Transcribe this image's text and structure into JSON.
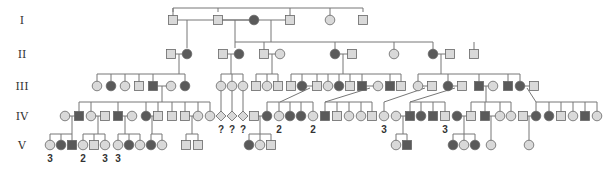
{
  "colors": {
    "affected": "#5a5a5a",
    "unaffected": "#d9d9d9",
    "stroke": "#666666",
    "line": "#777777"
  },
  "legend_symbols": {
    "square": "male",
    "circle": "female",
    "diamond": "sex unknown",
    "filled": "affected",
    "open": "unaffected"
  },
  "generations": [
    {
      "label": "I",
      "y": 20
    },
    {
      "label": "II",
      "y": 54
    },
    {
      "label": "III",
      "y": 86
    },
    {
      "label": "IV",
      "y": 116
    },
    {
      "label": "V",
      "y": 145
    }
  ],
  "individuals": [
    {
      "id": "I-1",
      "gen": 0,
      "x": 173,
      "sex": "M",
      "affected": false
    },
    {
      "id": "I-2",
      "gen": 0,
      "x": 218,
      "sex": "M",
      "affected": false
    },
    {
      "id": "I-3",
      "gen": 0,
      "x": 254,
      "sex": "F",
      "affected": true
    },
    {
      "id": "I-4",
      "gen": 0,
      "x": 290,
      "sex": "M",
      "affected": false
    },
    {
      "id": "I-5",
      "gen": 0,
      "x": 330,
      "sex": "F",
      "affected": false
    },
    {
      "id": "I-6",
      "gen": 0,
      "x": 363,
      "sex": "M",
      "affected": false
    },
    {
      "id": "II-1",
      "gen": 1,
      "x": 171,
      "sex": "M",
      "affected": false
    },
    {
      "id": "II-2",
      "gen": 1,
      "x": 187,
      "sex": "F",
      "affected": true
    },
    {
      "id": "II-3",
      "gen": 1,
      "x": 223,
      "sex": "M",
      "affected": false
    },
    {
      "id": "II-4",
      "gen": 1,
      "x": 239,
      "sex": "F",
      "affected": true
    },
    {
      "id": "II-5",
      "gen": 1,
      "x": 264,
      "sex": "M",
      "affected": false
    },
    {
      "id": "II-6",
      "gen": 1,
      "x": 280,
      "sex": "F",
      "affected": false
    },
    {
      "id": "II-7",
      "gen": 1,
      "x": 335,
      "sex": "F",
      "affected": true
    },
    {
      "id": "II-8",
      "gen": 1,
      "x": 352,
      "sex": "M",
      "affected": false
    },
    {
      "id": "II-9",
      "gen": 1,
      "x": 394,
      "sex": "F",
      "affected": false
    },
    {
      "id": "II-10",
      "gen": 1,
      "x": 433,
      "sex": "F",
      "affected": true
    },
    {
      "id": "II-11",
      "gen": 1,
      "x": 450,
      "sex": "M",
      "affected": false
    },
    {
      "id": "II-12",
      "gen": 1,
      "x": 474,
      "sex": "M",
      "affected": false
    },
    {
      "id": "III-1",
      "gen": 2,
      "x": 97,
      "sex": "F",
      "affected": false
    },
    {
      "id": "III-2",
      "gen": 2,
      "x": 111,
      "sex": "F",
      "affected": true
    },
    {
      "id": "III-3",
      "gen": 2,
      "x": 125,
      "sex": "F",
      "affected": false
    },
    {
      "id": "III-4",
      "gen": 2,
      "x": 139,
      "sex": "M",
      "affected": false
    },
    {
      "id": "III-5",
      "gen": 2,
      "x": 153,
      "sex": "M",
      "affected": true
    },
    {
      "id": "III-6",
      "gen": 2,
      "x": 171,
      "sex": "F",
      "affected": false
    },
    {
      "id": "III-7",
      "gen": 2,
      "x": 185,
      "sex": "F",
      "affected": true
    },
    {
      "id": "III-8",
      "gen": 2,
      "x": 221,
      "sex": "F",
      "affected": false
    },
    {
      "id": "III-9",
      "gen": 2,
      "x": 232,
      "sex": "F",
      "affected": false
    },
    {
      "id": "III-10",
      "gen": 2,
      "x": 243,
      "sex": "F",
      "affected": false
    },
    {
      "id": "III-11",
      "gen": 2,
      "x": 256,
      "sex": "M",
      "affected": false
    },
    {
      "id": "III-12",
      "gen": 2,
      "x": 267,
      "sex": "F",
      "affected": false
    },
    {
      "id": "III-13",
      "gen": 2,
      "x": 278,
      "sex": "M",
      "affected": false
    },
    {
      "id": "III-14",
      "gen": 2,
      "x": 291,
      "sex": "M",
      "affected": false
    },
    {
      "id": "III-15",
      "gen": 2,
      "x": 302,
      "sex": "F",
      "affected": true
    },
    {
      "id": "III-16",
      "gen": 2,
      "x": 317,
      "sex": "M",
      "affected": false
    },
    {
      "id": "III-17",
      "gen": 2,
      "x": 328,
      "sex": "F",
      "affected": false
    },
    {
      "id": "III-18",
      "gen": 2,
      "x": 339,
      "sex": "F",
      "affected": true
    },
    {
      "id": "III-19",
      "gen": 2,
      "x": 350,
      "sex": "M",
      "affected": false
    },
    {
      "id": "III-20",
      "gen": 2,
      "x": 362,
      "sex": "M",
      "affected": true
    },
    {
      "id": "III-21",
      "gen": 2,
      "x": 378,
      "sex": "F",
      "affected": false
    },
    {
      "id": "III-22",
      "gen": 2,
      "x": 390,
      "sex": "M",
      "affected": true
    },
    {
      "id": "III-23",
      "gen": 2,
      "x": 401,
      "sex": "M",
      "affected": false
    },
    {
      "id": "III-24",
      "gen": 2,
      "x": 418,
      "sex": "F",
      "affected": false
    },
    {
      "id": "III-25",
      "gen": 2,
      "x": 432,
      "sex": "M",
      "affected": false
    },
    {
      "id": "III-26",
      "gen": 2,
      "x": 448,
      "sex": "F",
      "affected": true
    },
    {
      "id": "III-27",
      "gen": 2,
      "x": 462,
      "sex": "M",
      "affected": false
    },
    {
      "id": "III-28",
      "gen": 2,
      "x": 479,
      "sex": "M",
      "affected": true
    },
    {
      "id": "III-29",
      "gen": 2,
      "x": 493,
      "sex": "F",
      "affected": false
    },
    {
      "id": "III-30",
      "gen": 2,
      "x": 508,
      "sex": "M",
      "affected": true
    },
    {
      "id": "III-31",
      "gen": 2,
      "x": 520,
      "sex": "F",
      "affected": true
    },
    {
      "id": "III-32",
      "gen": 2,
      "x": 534,
      "sex": "M",
      "affected": false
    },
    {
      "id": "IV-1",
      "gen": 3,
      "x": 65,
      "sex": "F",
      "affected": false
    },
    {
      "id": "IV-2",
      "gen": 3,
      "x": 79,
      "sex": "M",
      "affected": true
    },
    {
      "id": "IV-3",
      "gen": 3,
      "x": 91,
      "sex": "F",
      "affected": false
    },
    {
      "id": "IV-4",
      "gen": 3,
      "x": 105,
      "sex": "M",
      "affected": false
    },
    {
      "id": "IV-5",
      "gen": 3,
      "x": 118,
      "sex": "M",
      "affected": true
    },
    {
      "id": "IV-6",
      "gen": 3,
      "x": 132,
      "sex": "F",
      "affected": false
    },
    {
      "id": "IV-7",
      "gen": 3,
      "x": 146,
      "sex": "F",
      "affected": true
    },
    {
      "id": "IV-8",
      "gen": 3,
      "x": 158,
      "sex": "M",
      "affected": false
    },
    {
      "id": "IV-9",
      "gen": 3,
      "x": 172,
      "sex": "M",
      "affected": false
    },
    {
      "id": "IV-10",
      "gen": 3,
      "x": 185,
      "sex": "M",
      "affected": false
    },
    {
      "id": "IV-11",
      "gen": 3,
      "x": 198,
      "sex": "F",
      "affected": false
    },
    {
      "id": "IV-12",
      "gen": 3,
      "x": 210,
      "sex": "F",
      "affected": false
    },
    {
      "id": "IV-13",
      "gen": 3,
      "x": 221,
      "sex": "U",
      "affected": false,
      "note": "?"
    },
    {
      "id": "IV-14",
      "gen": 3,
      "x": 232,
      "sex": "U",
      "affected": false,
      "note": "?"
    },
    {
      "id": "IV-15",
      "gen": 3,
      "x": 243,
      "sex": "U",
      "affected": false,
      "note": "?"
    },
    {
      "id": "IV-16",
      "gen": 3,
      "x": 254,
      "sex": "M",
      "affected": false
    },
    {
      "id": "IV-17",
      "gen": 3,
      "x": 267,
      "sex": "F",
      "affected": true
    },
    {
      "id": "IV-18",
      "gen": 3,
      "x": 279,
      "sex": "F",
      "affected": false,
      "note": "2"
    },
    {
      "id": "IV-19",
      "gen": 3,
      "x": 290,
      "sex": "F",
      "affected": true
    },
    {
      "id": "IV-20",
      "gen": 3,
      "x": 301,
      "sex": "F",
      "affected": true
    },
    {
      "id": "IV-21",
      "gen": 3,
      "x": 313,
      "sex": "F",
      "affected": false,
      "note": "2"
    },
    {
      "id": "IV-22",
      "gen": 3,
      "x": 325,
      "sex": "M",
      "affected": true
    },
    {
      "id": "IV-23",
      "gen": 3,
      "x": 337,
      "sex": "M",
      "affected": false
    },
    {
      "id": "IV-24",
      "gen": 3,
      "x": 349,
      "sex": "F",
      "affected": false
    },
    {
      "id": "IV-25",
      "gen": 3,
      "x": 361,
      "sex": "F",
      "affected": false
    },
    {
      "id": "IV-26",
      "gen": 3,
      "x": 372,
      "sex": "M",
      "affected": false
    },
    {
      "id": "IV-27",
      "gen": 3,
      "x": 384,
      "sex": "F",
      "affected": false,
      "note": "3"
    },
    {
      "id": "IV-28",
      "gen": 3,
      "x": 396,
      "sex": "F",
      "affected": false
    },
    {
      "id": "IV-29",
      "gen": 3,
      "x": 410,
      "sex": "M",
      "affected": true
    },
    {
      "id": "IV-30",
      "gen": 3,
      "x": 421,
      "sex": "F",
      "affected": true
    },
    {
      "id": "IV-31",
      "gen": 3,
      "x": 433,
      "sex": "M",
      "affected": true
    },
    {
      "id": "IV-32",
      "gen": 3,
      "x": 445,
      "sex": "M",
      "affected": false,
      "note": "3"
    },
    {
      "id": "IV-33",
      "gen": 3,
      "x": 457,
      "sex": "F",
      "affected": true
    },
    {
      "id": "IV-34",
      "gen": 3,
      "x": 471,
      "sex": "M",
      "affected": false
    },
    {
      "id": "IV-35",
      "gen": 3,
      "x": 485,
      "sex": "M",
      "affected": true
    },
    {
      "id": "IV-36",
      "gen": 3,
      "x": 500,
      "sex": "F",
      "affected": false
    },
    {
      "id": "IV-37",
      "gen": 3,
      "x": 511,
      "sex": "F",
      "affected": false
    },
    {
      "id": "IV-38",
      "gen": 3,
      "x": 523,
      "sex": "M",
      "affected": false
    },
    {
      "id": "IV-39",
      "gen": 3,
      "x": 536,
      "sex": "F",
      "affected": true
    },
    {
      "id": "IV-40",
      "gen": 3,
      "x": 549,
      "sex": "F",
      "affected": true
    },
    {
      "id": "IV-41",
      "gen": 3,
      "x": 561,
      "sex": "M",
      "affected": false
    },
    {
      "id": "IV-42",
      "gen": 3,
      "x": 573,
      "sex": "F",
      "affected": false
    },
    {
      "id": "IV-43",
      "gen": 3,
      "x": 585,
      "sex": "M",
      "affected": true
    },
    {
      "id": "IV-44",
      "gen": 3,
      "x": 597,
      "sex": "F",
      "affected": false
    },
    {
      "id": "V-1",
      "gen": 4,
      "x": 50,
      "sex": "F",
      "affected": false,
      "note": "3"
    },
    {
      "id": "V-2",
      "gen": 4,
      "x": 61,
      "sex": "F",
      "affected": true
    },
    {
      "id": "V-3",
      "gen": 4,
      "x": 72,
      "sex": "M",
      "affected": true
    },
    {
      "id": "V-4",
      "gen": 4,
      "x": 83,
      "sex": "F",
      "affected": false,
      "note": "2"
    },
    {
      "id": "V-5",
      "gen": 4,
      "x": 94,
      "sex": "M",
      "affected": false
    },
    {
      "id": "V-6",
      "gen": 4,
      "x": 105,
      "sex": "F",
      "affected": false,
      "note": "3"
    },
    {
      "id": "V-7",
      "gen": 4,
      "x": 118,
      "sex": "F",
      "affected": false,
      "note": "3"
    },
    {
      "id": "V-8",
      "gen": 4,
      "x": 129,
      "sex": "F",
      "affected": true
    },
    {
      "id": "V-9",
      "gen": 4,
      "x": 140,
      "sex": "F",
      "affected": false
    },
    {
      "id": "V-10",
      "gen": 4,
      "x": 151,
      "sex": "F",
      "affected": true
    },
    {
      "id": "V-11",
      "gen": 4,
      "x": 162,
      "sex": "F",
      "affected": false
    },
    {
      "id": "V-12",
      "gen": 4,
      "x": 186,
      "sex": "M",
      "affected": false
    },
    {
      "id": "V-13",
      "gen": 4,
      "x": 198,
      "sex": "M",
      "affected": false
    },
    {
      "id": "V-14",
      "gen": 4,
      "x": 249,
      "sex": "F",
      "affected": true
    },
    {
      "id": "V-15",
      "gen": 4,
      "x": 260,
      "sex": "F",
      "affected": false
    },
    {
      "id": "V-16",
      "gen": 4,
      "x": 271,
      "sex": "M",
      "affected": false
    },
    {
      "id": "V-17",
      "gen": 4,
      "x": 396,
      "sex": "F",
      "affected": false
    },
    {
      "id": "V-18",
      "gen": 4,
      "x": 407,
      "sex": "M",
      "affected": true
    },
    {
      "id": "V-19",
      "gen": 4,
      "x": 453,
      "sex": "F",
      "affected": true
    },
    {
      "id": "V-20",
      "gen": 4,
      "x": 464,
      "sex": "F",
      "affected": false
    },
    {
      "id": "V-21",
      "gen": 4,
      "x": 475,
      "sex": "F",
      "affected": true
    },
    {
      "id": "V-22",
      "gen": 4,
      "x": 491,
      "sex": "F",
      "affected": false
    },
    {
      "id": "V-23",
      "gen": 4,
      "x": 529,
      "sex": "F",
      "affected": false
    }
  ],
  "lines": [
    "M173 20 H254 M218 20 M254 20 H290",
    "M173 12 V8 H363 V12",
    "M330 8 V16",
    "M173 8 V16 M218 8 V12 M290 8 V16",
    "M218 20 H254",
    "M235 20 V42 M271 20 V42",
    "M187 20 V42",
    "M235 42 H433 M433 42 V50 M335 42 V50 M394 42 V50 M474 42 V50 M264 42 V50",
    "M187 42 V48 M235 42 V48",
    "M171 54 H187 M223 54 H239 M264 54 H280 M335 54 H352 M433 54 H450",
    "M179 54 V74 M97 74 H185 M97 74 V82 M111 74 V82 M125 74 V82 M139 74 V82 M153 74 V82 M185 74 V82",
    "M231 54 V74 M221 74 H243 M221 74 V82 M232 74 V82 M243 74 V82",
    "M272 54 V74 M256 74 H278 M256 74 V82 M267 74 V82 M278 74 V82",
    "M343 54 V74 M291 74 H401 M291 74 V82 M302 74 V82 M317 74 V82 M328 74 V82 M339 74 V82 M350 74 V82 M362 74 V82 M390 74 V82 M401 74 V82",
    "M441 54 V74 M418 74 H520 M418 74 V82 M448 74 V82 M479 74 V82 M508 74 V82 M520 74 V82",
    "M153 86 H171 M162 86 V102 M79 102 H210 M79 102 V112 M91 102 V112 M118 102 V112 M146 102 V112 M158 102 V112 M172 102 V112 M185 102 V112 M198 102 V112 M210 102 V112",
    "M221 90 V112 M232 90 V112 M243 90 V112",
    "M302 86 H317 M310 88 L280 102 M267 102 H313 M267 102 V112 M279 102 V112 M290 102 V112 M301 102 V112 M313 102 V112",
    "M362 86 H378 M370 88 L325 102 M325 102 H372 M325 102 V112 M337 102 V112 M349 102 V112 M361 102 V112 M372 102 V112",
    "M418 86 H432 M425 88 L384 102 M384 102 V112",
    "M448 86 H462 M455 88 L410 102 M410 102 H445 M410 102 V112 M421 102 V112 M433 102 V112 M445 102 V112",
    "M479 86 H493 M486 86 V102 M471 102 H511 M471 102 V112 M485 102 V112 M500 102 V112 M511 102 V112",
    "M520 86 H534 M527 88 L536 102 M536 102 H597 M549 102 V112 M561 102 V112 M573 102 V112 M585 102 V112 M597 102 V112 M536 102 V112",
    "M65 116 H79 M72 116 V134 M50 134 H72 M50 134 V141 M61 134 V141 M72 134 V141",
    "M91 116 H105 M98 116 V134 M83 134 H105 M83 134 V141 M94 134 V141 M105 134 V141",
    "M118 116 H132 M125 116 V134 M118 134 H140 M118 134 V141 M129 134 V141 M140 134 V141",
    "M146 116 H158 M152 116 V134 M151 134 H162 M151 134 V141 M162 134 V141",
    "M198 116 H186 M192 116 V134 M186 134 H198 M186 134 V141 M198 134 V141",
    "M254 116 H267 M260 116 V134 M249 134 H271 M249 134 V141 M260 134 V141 M271 134 V141",
    "M396 116 H410 M403 116 V134 M396 134 H407 M396 134 V141 M407 134 V141",
    "M457 116 H471 M464 116 V134 M453 134 H475 M453 134 V141 M464 134 V141 M475 134 V141",
    "M485 116 H500 M491 116 V141",
    "M523 116 H536 M529 116 V141"
  ],
  "chart_data": {
    "type": "pedigree",
    "title": "",
    "generations": [
      "I",
      "II",
      "III",
      "IV",
      "V"
    ],
    "symbols": {
      "square": "male",
      "circle": "female",
      "diamond": "unknown sex",
      "dark fill": "affected",
      "light fill": "unaffected"
    },
    "annotations": [
      {
        "gen": "IV",
        "text": "?",
        "count": 3
      },
      {
        "gen": "IV",
        "text": "2",
        "count": 2
      },
      {
        "gen": "IV",
        "text": "3",
        "count": 2
      },
      {
        "gen": "V",
        "text": "3",
        "count": 3
      },
      {
        "gen": "V",
        "text": "2",
        "count": 1
      }
    ]
  }
}
